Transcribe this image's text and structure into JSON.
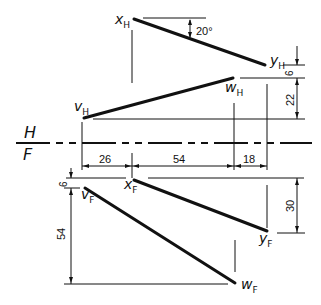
{
  "diagram": {
    "type": "orthographic projection (two-view descriptive geometry)",
    "fold_line": {
      "top_label": "H",
      "bottom_label": "F"
    },
    "points": {
      "xH": {
        "main": "x",
        "sub": "H"
      },
      "yH": {
        "main": "y",
        "sub": "H"
      },
      "vH": {
        "main": "v",
        "sub": "H"
      },
      "wH": {
        "main": "w",
        "sub": "H"
      },
      "xF": {
        "main": "x",
        "sub": "F"
      },
      "yF": {
        "main": "y",
        "sub": "F"
      },
      "vF": {
        "main": "v",
        "sub": "F"
      },
      "wF": {
        "main": "w",
        "sub": "F"
      }
    },
    "dimensions": {
      "angle": "20°",
      "top_right_small": "6",
      "top_right_large": "22",
      "horiz_left": "26",
      "horiz_middle": "54",
      "horiz_right": "18",
      "front_left_small": "6",
      "front_left_large": "54",
      "front_right": "30"
    },
    "lines": [
      {
        "name": "line-xy-top-view",
        "from": "xH",
        "to": "yH"
      },
      {
        "name": "line-vw-top-view",
        "from": "vH",
        "to": "wH"
      },
      {
        "name": "line-xy-front-view",
        "from": "xF",
        "to": "yF"
      },
      {
        "name": "line-vw-front-view",
        "from": "vF",
        "to": "wF"
      }
    ]
  }
}
